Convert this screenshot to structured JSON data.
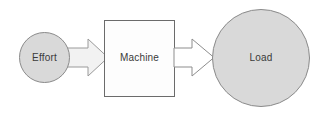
{
  "diagram": {
    "background_color": "#ffffff",
    "width": 326,
    "height": 119,
    "nodes": [
      {
        "id": "effort",
        "label": "Effort",
        "shape": "circle",
        "cx": 44.5,
        "cy": 57.5,
        "r": 25.5,
        "fill": "#d9d9d9",
        "stroke": "#888888",
        "text_color": "#3a3a3a"
      },
      {
        "id": "machine",
        "label": "Machine",
        "shape": "rectangle",
        "x": 104,
        "y": 20,
        "width": 71,
        "height": 77,
        "fill": "#fdfdfd",
        "stroke": "#6b6b6b",
        "text_color": "#3a3a3a"
      },
      {
        "id": "load",
        "label": "Load",
        "shape": "circle",
        "cx": 261,
        "cy": 58,
        "r": 49,
        "fill": "#d9d9d9",
        "stroke": "#888888",
        "text_color": "#3a3a3a"
      }
    ],
    "connectors": [
      {
        "id": "effort-to-machine",
        "from": "effort",
        "to": "machine",
        "shape": "block-arrow",
        "direction": "right",
        "fill": "#f2f2f2",
        "stroke": "#9a9a9a"
      },
      {
        "id": "machine-to-load",
        "from": "machine",
        "to": "load",
        "shape": "block-arrow",
        "direction": "right",
        "fill": "#ffffff",
        "stroke": "#8d8d8d"
      }
    ]
  }
}
